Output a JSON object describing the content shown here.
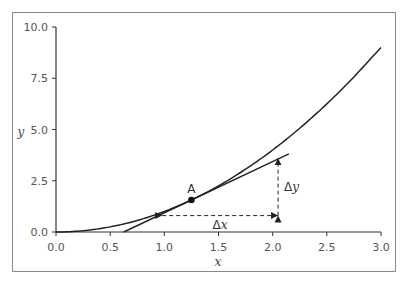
{
  "chart_data": {
    "type": "line",
    "title": "",
    "xlabel": "x",
    "ylabel": "y",
    "xlim": [
      0,
      3.0
    ],
    "ylim": [
      0,
      10.0
    ],
    "grid": false,
    "legend": null,
    "x_ticks": [
      "0.0",
      "0.5",
      "1.0",
      "1.5",
      "2.0",
      "2.5",
      "3.0"
    ],
    "y_ticks": [
      "0.0",
      "2.5",
      "5.0",
      "7.5",
      "10.0"
    ],
    "series": [
      {
        "name": "curve y = x^2",
        "x": [
          0.0,
          0.25,
          0.5,
          0.75,
          1.0,
          1.25,
          1.5,
          1.75,
          2.0,
          2.25,
          2.5,
          2.75,
          3.0
        ],
        "values": [
          0.0,
          0.0625,
          0.25,
          0.5625,
          1.0,
          1.5625,
          2.25,
          3.0625,
          4.0,
          5.0625,
          6.25,
          7.5625,
          9.0
        ]
      },
      {
        "name": "tangent line at A",
        "x": [
          0.625,
          2.15
        ],
        "values": [
          0.0,
          3.81
        ]
      }
    ],
    "annotations": [
      {
        "label": "A",
        "type": "point",
        "x": 1.25,
        "y": 1.5625
      },
      {
        "label": "Δx",
        "type": "dashed-arrow-horizontal",
        "x_from": 0.98,
        "x_to": 2.05,
        "y": 0.8
      },
      {
        "label": "Δy",
        "type": "dashed-arrow-vertical",
        "x": 2.05,
        "y_from": 0.8,
        "y_to": 3.6
      }
    ]
  },
  "labels": {
    "point_a": "A",
    "delta_x": "Δx",
    "delta_x_symbol": "Δ",
    "delta_x_var": "x",
    "delta_y_symbol": "Δ",
    "delta_y_var": "y",
    "x_axis": "x",
    "y_axis": "y",
    "x_ticks": [
      "0.0",
      "0.5",
      "1.0",
      "1.5",
      "2.0",
      "2.5",
      "3.0"
    ],
    "y_ticks": [
      "0.0",
      "2.5",
      "5.0",
      "7.5",
      "10.0"
    ]
  },
  "colors": {
    "line": "#222222",
    "frame": "#888888",
    "text": "#555555"
  }
}
